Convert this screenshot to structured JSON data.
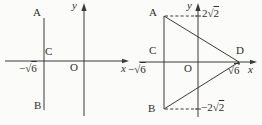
{
  "canvas": {
    "background": "#fbfbf9",
    "ink_color": "#3a3a3a"
  },
  "left_figure": {
    "point_a": "A",
    "point_b": "B",
    "point_c": "C",
    "origin": "O",
    "x_axis_label": "x",
    "y_axis_label": "y",
    "neg_sqrt6": {
      "pre": "−√",
      "rad": "6"
    }
  },
  "right_figure": {
    "point_a": "A",
    "point_b": "B",
    "point_c": "C",
    "point_d": "D",
    "origin": "O",
    "x_axis_label": "x",
    "y_axis_label": "y",
    "pos_2sqrt2": {
      "pre": "2√",
      "rad": "2"
    },
    "neg_2sqrt2": {
      "pre": "−2√",
      "rad": "2"
    },
    "neg_sqrt6": {
      "pre": "−√",
      "rad": "6"
    },
    "sqrt6": {
      "pre": "√",
      "rad": "6"
    }
  }
}
